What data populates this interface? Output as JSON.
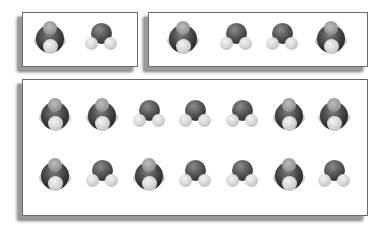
{
  "figure": {
    "colors": {
      "oxygen": "#3a3a3a",
      "hydrogen": "#d2d2d2",
      "border": "#6a6a6a",
      "shadow": "#8a8a8a"
    },
    "panels": [
      {
        "name": "panel-small",
        "molecules": [
          "front",
          "vee"
        ]
      },
      {
        "name": "panel-medium",
        "molecules": [
          "front",
          "vee",
          "vee",
          "front"
        ]
      },
      {
        "name": "panel-large",
        "rows": [
          [
            "front",
            "front",
            "vee",
            "vee",
            "vee",
            "front",
            "front"
          ],
          [
            "front",
            "vee",
            "front",
            "vee",
            "vee",
            "front",
            "vee"
          ]
        ]
      }
    ]
  }
}
